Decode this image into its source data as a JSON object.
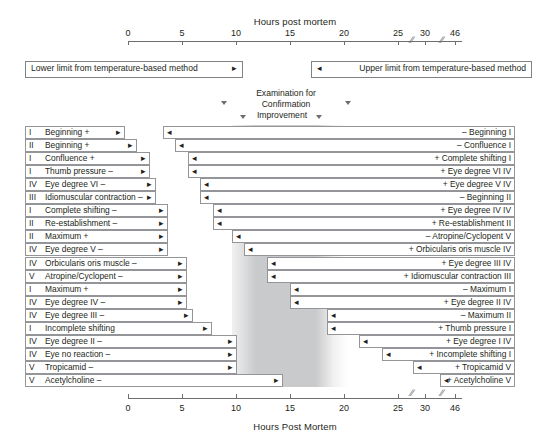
{
  "axis": {
    "title_top": "Hours post mortem",
    "title_bottom": "Hours Post Mortem",
    "ticks": [
      {
        "label": "0",
        "value": 0,
        "x": 128
      },
      {
        "label": "5",
        "value": 5,
        "x": 182
      },
      {
        "label": "10",
        "value": 10,
        "x": 236
      },
      {
        "label": "15",
        "value": 15,
        "x": 290
      },
      {
        "label": "20",
        "value": 20,
        "x": 344
      },
      {
        "label": "25",
        "value": 25,
        "x": 398
      },
      {
        "label": "30",
        "value": 30,
        "x": 425
      },
      {
        "label": "46",
        "value": 46,
        "x": 455
      }
    ],
    "breaks_x": [
      411,
      441
    ],
    "line_start_x": 128,
    "line_end_x": 462
  },
  "limits": {
    "lower": {
      "label": "Lower limit from temperature-based method",
      "arrow": "right-arrow-icon",
      "x": 25,
      "w": 216
    },
    "upper": {
      "label": "Upper limit from temperature-based method",
      "arrow": "left-arrow-icon",
      "x": 311,
      "w": 219
    }
  },
  "examination": {
    "lines": [
      "Examination for",
      "Confirmation",
      "Improvement"
    ],
    "markers": [
      {
        "name": "marker-outer-left",
        "x": 224,
        "y": 101
      },
      {
        "name": "marker-outer-right",
        "x": 348,
        "y": 101
      },
      {
        "name": "marker-inner-left",
        "x": 243,
        "y": 115
      },
      {
        "name": "marker-inner-right",
        "x": 319,
        "y": 115
      }
    ]
  },
  "band": {
    "core_color": "#c9cacb",
    "fade_color": "#f1f1f2",
    "left_fade_x": 232,
    "left_fade_w": 24,
    "core_x": 256,
    "core_w": 60,
    "right_fade_x": 316,
    "right_fade_w": 18,
    "tail_x": 334,
    "tail_w": 14
  },
  "chart_data": {
    "type": "bar",
    "xlabel": "Hours Post Mortem",
    "ylabel": "",
    "xlim": [
      0,
      46
    ],
    "grid": false,
    "legend": "none",
    "rows": [
      {
        "roman_left": "I",
        "left": "Beginning +",
        "right": "– Beginning I",
        "lbar_x": 25,
        "lbar_w": 100,
        "rbar_x": 163,
        "rbar_w": 352
      },
      {
        "roman_left": "II",
        "left": "Beginning +",
        "right": "– Confluence I",
        "lbar_x": 25,
        "lbar_w": 112,
        "rbar_x": 175,
        "rbar_w": 340
      },
      {
        "roman_left": "I",
        "left": "Confluence +",
        "right": "+ Complete shifting I",
        "lbar_x": 25,
        "lbar_w": 125,
        "rbar_x": 188,
        "rbar_w": 327
      },
      {
        "roman_left": "I",
        "left": "Thumb pressure –",
        "right": "+ Eye degree VI IV",
        "lbar_x": 25,
        "lbar_w": 125,
        "rbar_x": 188,
        "rbar_w": 327
      },
      {
        "roman_left": "IV",
        "left": "Eye degree VI –",
        "right": "+ Eye degree V IV",
        "lbar_x": 25,
        "lbar_w": 131,
        "rbar_x": 200,
        "rbar_w": 315
      },
      {
        "roman_left": "III",
        "left": "Idiomuscular contraction –",
        "right": "– Beginning II",
        "lbar_x": 25,
        "lbar_w": 131,
        "rbar_x": 200,
        "rbar_w": 315
      },
      {
        "roman_left": "I",
        "left": "Complete shifting –",
        "right": "+ Eye degree IV IV",
        "lbar_x": 25,
        "lbar_w": 143,
        "rbar_x": 213,
        "rbar_w": 302
      },
      {
        "roman_left": "II",
        "left": "Re-establishment –",
        "right": "+ Re-establishment II",
        "lbar_x": 25,
        "lbar_w": 143,
        "rbar_x": 213,
        "rbar_w": 302
      },
      {
        "roman_left": "II",
        "left": "Maximum +",
        "right": "– Atropine/Cyclopent V",
        "lbar_x": 25,
        "lbar_w": 143,
        "rbar_x": 232,
        "rbar_w": 283
      },
      {
        "roman_left": "IV",
        "left": "Eye degree V  –",
        "right": "+ Orbicularis oris muscle IV",
        "lbar_x": 25,
        "lbar_w": 143,
        "rbar_x": 244,
        "rbar_w": 271
      },
      {
        "roman_left": "IV",
        "left": "Orbicularis oris muscle –",
        "right": "+ Eye degree III IV",
        "lbar_x": 25,
        "lbar_w": 162,
        "rbar_x": 267,
        "rbar_w": 248
      },
      {
        "roman_left": "V",
        "left": "Atropine/Cyclopent –",
        "right": "+ Idiomuscular contraction III",
        "lbar_x": 25,
        "lbar_w": 162,
        "rbar_x": 267,
        "rbar_w": 248
      },
      {
        "roman_left": "I",
        "left": "Maximum +",
        "right": "– Maximum I",
        "lbar_x": 25,
        "lbar_w": 162,
        "rbar_x": 290,
        "rbar_w": 225
      },
      {
        "roman_left": "IV",
        "left": "Eye degree IV  –",
        "right": "+ Eye degree II IV",
        "lbar_x": 25,
        "lbar_w": 162,
        "rbar_x": 290,
        "rbar_w": 225
      },
      {
        "roman_left": "IV",
        "left": "Eye degree III  –",
        "right": "– Maximum II",
        "lbar_x": 25,
        "lbar_w": 168,
        "rbar_x": 327,
        "rbar_w": 188
      },
      {
        "roman_left": "I",
        "left": "Incomplete shifting",
        "right": "+ Thumb pressure I",
        "lbar_x": 25,
        "lbar_w": 187,
        "rbar_x": 327,
        "rbar_w": 188
      },
      {
        "roman_left": "IV",
        "left": "Eye degree II –",
        "right": "+ Eye degree I IV",
        "lbar_x": 25,
        "lbar_w": 212,
        "rbar_x": 359,
        "rbar_w": 156
      },
      {
        "roman_left": "IV",
        "left": "Eye no reaction –",
        "right": "+ Incomplete shifting I",
        "lbar_x": 25,
        "lbar_w": 212,
        "rbar_x": 382,
        "rbar_w": 133
      },
      {
        "roman_left": "V",
        "left": "Tropicamid –",
        "right": "+ Tropicamid V",
        "lbar_x": 25,
        "lbar_w": 212,
        "rbar_x": 413,
        "rbar_w": 102
      },
      {
        "roman_left": "V",
        "left": "Acetylcholine –",
        "right": "+ Acetylcholine V",
        "lbar_x": 25,
        "lbar_w": 258,
        "rbar_x": 440,
        "rbar_w": 75
      }
    ]
  },
  "icons": {
    "left_arrow": "◂",
    "right_arrow": "▸",
    "idio_arrow": "→"
  }
}
